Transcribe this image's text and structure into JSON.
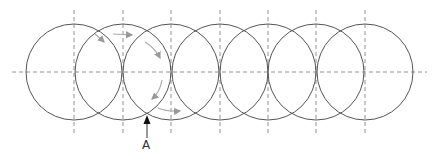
{
  "diagram": {
    "label": "A",
    "colors": {
      "circle_stroke": "#555555",
      "guide_dash": "#777777",
      "path_arrow": "#aaaaaa",
      "pointer_arrow": "#222222"
    },
    "circles": {
      "count": 7,
      "radius": 48,
      "cy": 72,
      "centers_x": [
        74,
        123,
        171,
        220,
        268,
        316,
        365
      ]
    },
    "axis": {
      "y": 72,
      "x1": 12,
      "x2": 427
    },
    "vertical_guides": {
      "y1": 10,
      "y2": 134
    },
    "pointer": {
      "x": 147,
      "y_tip": 116,
      "y_tail": 138,
      "label_x": 142,
      "label_y": 139
    }
  }
}
